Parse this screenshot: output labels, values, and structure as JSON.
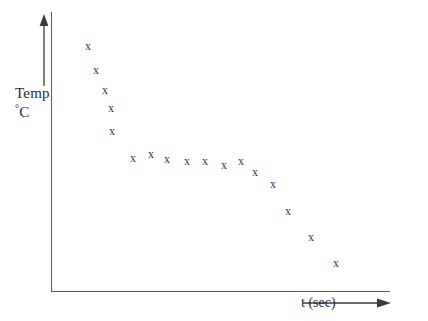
{
  "chart_data": {
    "type": "scatter",
    "title": "",
    "subtitle": "",
    "xlabel": "t (sec)",
    "ylabel": "Temp °C",
    "ylabel_lines": [
      "Temp",
      "C"
    ],
    "ylabel_degree_symbol": "°",
    "xlabel_text": "t (sec)",
    "marker_glyph": "x",
    "grid": false,
    "legend": null,
    "axis_ticks": [],
    "xlim": [
      0,
      100
    ],
    "ylim": [
      0,
      100
    ],
    "series": [
      {
        "name": "Temperature vs time",
        "points": [
          {
            "x": 10.9,
            "y": 87.8
          },
          {
            "x": 13.3,
            "y": 79.2
          },
          {
            "x": 15.9,
            "y": 72.0
          },
          {
            "x": 17.7,
            "y": 65.6
          },
          {
            "x": 18.0,
            "y": 57.3
          },
          {
            "x": 24.2,
            "y": 47.7
          },
          {
            "x": 29.5,
            "y": 49.1
          },
          {
            "x": 34.2,
            "y": 47.3
          },
          {
            "x": 40.1,
            "y": 46.6
          },
          {
            "x": 45.4,
            "y": 46.6
          },
          {
            "x": 51.0,
            "y": 45.2
          },
          {
            "x": 56.0,
            "y": 46.6
          },
          {
            "x": 60.2,
            "y": 42.7
          },
          {
            "x": 65.5,
            "y": 38.4
          },
          {
            "x": 69.9,
            "y": 28.7
          },
          {
            "x": 76.7,
            "y": 19.3
          },
          {
            "x": 84.1,
            "y": 10.0
          }
        ],
        "pixels": [
          {
            "px": 88,
            "py": 46
          },
          {
            "px": 96,
            "py": 70
          },
          {
            "px": 105,
            "py": 90
          },
          {
            "px": 111,
            "py": 108
          },
          {
            "px": 112,
            "py": 131
          },
          {
            "px": 133,
            "py": 158
          },
          {
            "px": 151,
            "py": 154
          },
          {
            "px": 167,
            "py": 159
          },
          {
            "px": 187,
            "py": 161
          },
          {
            "px": 205,
            "py": 161
          },
          {
            "px": 224,
            "py": 165
          },
          {
            "px": 241,
            "py": 161
          },
          {
            "px": 255,
            "py": 172
          },
          {
            "px": 273,
            "py": 184
          },
          {
            "px": 288,
            "py": 211
          },
          {
            "px": 311,
            "py": 237
          },
          {
            "px": 336,
            "py": 263
          }
        ]
      }
    ]
  },
  "axes": {
    "vertical_axis_name": "temperature-axis",
    "horizontal_axis_name": "time-axis",
    "y_arrow_direction": "up",
    "x_arrow_direction": "right"
  }
}
